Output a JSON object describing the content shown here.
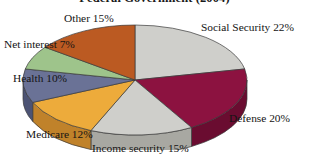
{
  "chart_data": {
    "type": "pie",
    "title": "Federal Government (2004)",
    "xlabel": "",
    "ylabel": "",
    "legend_position": "none",
    "grid": false,
    "three_d": true,
    "labels_show_percent": true,
    "categories": [
      "Social Security",
      "Defense",
      "Income security",
      "Medicare",
      "Health",
      "Net interest",
      "Other"
    ],
    "values": [
      22,
      20,
      15,
      12,
      10,
      7,
      15
    ],
    "colors": [
      "#cfcfcb",
      "#8c1240",
      "#cfcfcb",
      "#edab3b",
      "#6a7296",
      "#9ec48b",
      "#bb5a22"
    ],
    "slices": [
      {
        "name": "Social Security",
        "value": 22,
        "label": "Social Security 22%",
        "color": "#cfcfcb",
        "side_color": "#a8a8a2"
      },
      {
        "name": "Defense",
        "value": 20,
        "label": "Defense 20%",
        "color": "#8c1240",
        "side_color": "#6a0c30"
      },
      {
        "name": "Income security",
        "value": 15,
        "label": "Income security 15%",
        "color": "#cfcfcb",
        "side_color": "#a8a8a2"
      },
      {
        "name": "Medicare",
        "value": 12,
        "label": "Medicare 12%",
        "color": "#edab3b",
        "side_color": "#c0822a"
      },
      {
        "name": "Health",
        "value": 10,
        "label": "Health 10%",
        "color": "#6a7296",
        "side_color": "#4c5374"
      },
      {
        "name": "Net interest",
        "value": 7,
        "label": "Net interest 7%",
        "color": "#9ec48b",
        "side_color": "#7aa268"
      },
      {
        "name": "Other",
        "value": 15,
        "label": "Other 15%",
        "color": "#bb5a22",
        "side_color": "#93430f"
      }
    ]
  },
  "labels": {
    "social_security": "Social Security 22%",
    "defense": "Defense 20%",
    "income_security": "Income security 15%",
    "medicare": "Medicare 12%",
    "health": "Health 10%",
    "net_interest": "Net interest 7%",
    "other": "Other 15%"
  }
}
